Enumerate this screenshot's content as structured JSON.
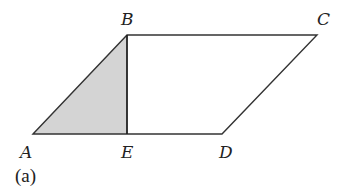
{
  "figure": {
    "caption": "(a)",
    "shape": "parallelogram ABCD with altitude BE",
    "vertices": {
      "A": {
        "label": "A",
        "x": 33,
        "y": 134
      },
      "B": {
        "label": "B",
        "x": 127,
        "y": 35
      },
      "C": {
        "label": "C",
        "x": 317,
        "y": 35
      },
      "D": {
        "label": "D",
        "x": 222,
        "y": 134
      },
      "E": {
        "label": "E",
        "x": 127,
        "y": 134
      }
    },
    "shaded_region": "triangle ABE",
    "colors": {
      "stroke": "#333333",
      "shade": "#d4d4d4",
      "background": "#ffffff"
    }
  }
}
